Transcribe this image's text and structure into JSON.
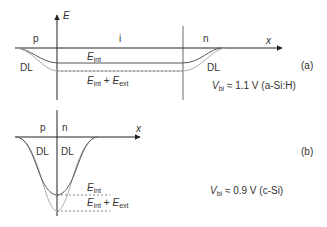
{
  "panel_a": {
    "axis_y_label": "E",
    "axis_x_label": "x",
    "region_p": "p",
    "region_i": "i",
    "region_n": "n",
    "dl_left": "DL",
    "dl_right": "DL",
    "e_int": {
      "main": "E",
      "sub": "int"
    },
    "e_sum": {
      "main1": "E",
      "sub1": "int",
      "plus": " + ",
      "main2": "E",
      "sub2": "ext"
    },
    "panel_tag": "(a)",
    "vbi": {
      "main": "V",
      "sub": "bi",
      "rest": " ≈ 1.1 V (a-Si:H)"
    }
  },
  "panel_b": {
    "axis_x_label": "x",
    "region_p": "p",
    "region_n": "n",
    "dl_left": "DL",
    "dl_right": "DL",
    "e_int": {
      "main": "E",
      "sub": "int"
    },
    "e_sum": {
      "main1": "E",
      "sub1": "int",
      "plus": " + ",
      "main2": "E",
      "sub2": "ext"
    },
    "panel_tag": "(b)",
    "vbi": {
      "main": "V",
      "sub": "bi",
      "rest": " ≈ 0.9 V (c-Si)"
    }
  },
  "colors": {
    "axis": "#222222",
    "curve_int": "#555555",
    "curve_ext": "#aaaaaa",
    "dashed": "#555555"
  }
}
